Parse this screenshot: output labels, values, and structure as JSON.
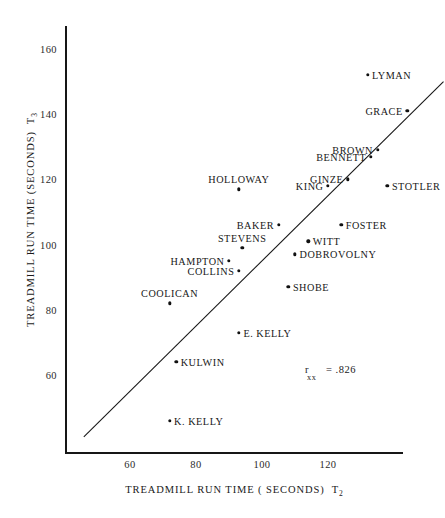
{
  "chart_data": {
    "type": "scatter",
    "title": "",
    "xlabel": "TREADMILL RUN TIME ( SECONDS)  T2",
    "ylabel": "TREADMILL RUN TIME (SECONDS)  T3",
    "xlabel_main": "TREADMILL RUN TIME ( SECONDS)",
    "xlabel_sub": "2",
    "ylabel_main": "TREADMILL RUN TIME (SECONDS)",
    "ylabel_sub": "3",
    "xticks": [
      60,
      80,
      100,
      120
    ],
    "yticks": [
      160,
      140,
      120,
      100,
      80,
      60
    ],
    "xlim": [
      46,
      148
    ],
    "ylim": [
      41,
      170
    ],
    "grid": false,
    "legend": null,
    "reference_line": {
      "kind": "identity",
      "label": "y = x",
      "from": [
        46,
        41
      ],
      "to": [
        155,
        150
      ]
    },
    "annotation": {
      "symbol": "r",
      "subscript": "xx",
      "equals": "= .826",
      "text": "r xx = .826",
      "value": 0.826
    },
    "point_color": "#111111",
    "axis_color": "#171717",
    "points": [
      {
        "label": "LYMAN",
        "x": 132,
        "y": 152,
        "label_pos": "right"
      },
      {
        "label": "GRACE",
        "x": 144,
        "y": 141,
        "label_pos": "left"
      },
      {
        "label": "BROWN",
        "x": 135,
        "y": 129,
        "label_pos": "left"
      },
      {
        "label": "BENNETT",
        "x": 133,
        "y": 127,
        "label_pos": "left"
      },
      {
        "label": "STOTLER",
        "x": 138,
        "y": 118,
        "label_pos": "right"
      },
      {
        "label": "GINZE",
        "x": 126,
        "y": 120,
        "label_pos": "left"
      },
      {
        "label": "KING",
        "x": 120,
        "y": 118,
        "label_pos": "left"
      },
      {
        "label": "HOLLOWAY",
        "x": 93,
        "y": 117,
        "label_pos": "above"
      },
      {
        "label": "FOSTER",
        "x": 124,
        "y": 106,
        "label_pos": "right"
      },
      {
        "label": "BAKER",
        "x": 105,
        "y": 106,
        "label_pos": "left"
      },
      {
        "label": "WITT",
        "x": 114,
        "y": 101,
        "label_pos": "right"
      },
      {
        "label": "STEVENS",
        "x": 94,
        "y": 99,
        "label_pos": "above"
      },
      {
        "label": "DOBROVOLNY",
        "x": 110,
        "y": 97,
        "label_pos": "right"
      },
      {
        "label": "HAMPTON",
        "x": 90,
        "y": 95,
        "label_pos": "left"
      },
      {
        "label": "COLLINS",
        "x": 93,
        "y": 92,
        "label_pos": "left"
      },
      {
        "label": "SHOBE",
        "x": 108,
        "y": 87,
        "label_pos": "right"
      },
      {
        "label": "COOLICAN",
        "x": 72,
        "y": 82,
        "label_pos": "above"
      },
      {
        "label": "E. KELLY",
        "x": 93,
        "y": 73,
        "label_pos": "right"
      },
      {
        "label": "KULWIN",
        "x": 74,
        "y": 64,
        "label_pos": "right"
      },
      {
        "label": "K. KELLY",
        "x": 72,
        "y": 46,
        "label_pos": "right"
      }
    ]
  }
}
